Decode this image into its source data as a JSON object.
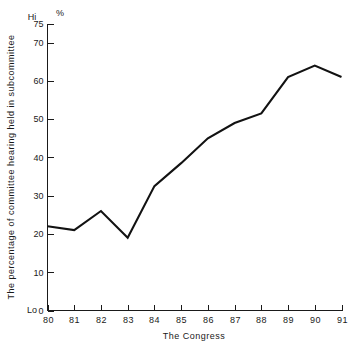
{
  "chart_data": {
    "type": "line",
    "title": "",
    "xlabel": "The Congress",
    "ylabel": "The percentage of committee hearing held in subcommittee",
    "yunit": "%",
    "y_high_marker": "Hi",
    "y_low_marker": "Lo",
    "categories": [
      "80",
      "81",
      "82",
      "83",
      "84",
      "85",
      "86",
      "87",
      "88",
      "89",
      "90",
      "91"
    ],
    "values": [
      22,
      21,
      26,
      19,
      32.5,
      38.5,
      45,
      49,
      51.5,
      61,
      64,
      61
    ],
    "xlim": [
      80,
      91
    ],
    "ylim": [
      0,
      75
    ],
    "yticks": [
      0,
      10,
      20,
      30,
      40,
      50,
      60,
      70,
      75
    ],
    "ytick_labels": [
      "0",
      "10",
      "20",
      "30",
      "40",
      "50",
      "60",
      "70",
      "75"
    ],
    "xticks": [
      80,
      81,
      82,
      83,
      84,
      85,
      86,
      87,
      88,
      89,
      90,
      91
    ],
    "xtick_labels": [
      "80",
      "81",
      "82",
      "83",
      "84",
      "85",
      "86",
      "87",
      "88",
      "89",
      "90",
      "91"
    ],
    "grid": false,
    "legend": null,
    "series_color": "#121212",
    "axis_color": "#1a1a1a",
    "background": "#ffffff"
  }
}
